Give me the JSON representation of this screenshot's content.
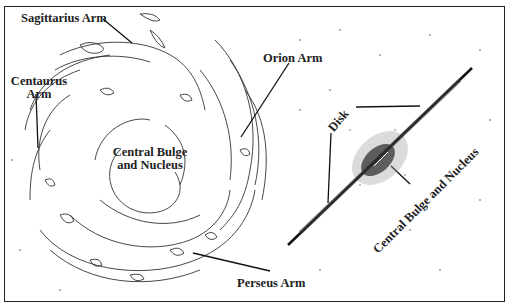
{
  "figure": {
    "title": "",
    "left_panel": {
      "description": "Face-on view of the Milky Way spiral structure",
      "labels": {
        "sagittarius": "Sagittarius Arm",
        "orion": "Orion Arm",
        "centaurus_line1": "Centaurus",
        "centaurus_line2": "Arm",
        "bulge_line1": "Central Bulge",
        "bulge_line2": "and Nucleus",
        "perseus": "Perseus Arm"
      }
    },
    "right_panel": {
      "description": "Edge-on view of the Milky Way",
      "labels": {
        "disk": "Disk",
        "bulge": "Central Bulge and Nucleus"
      }
    },
    "colors": {
      "ink": "#222222",
      "background": "#ffffff"
    }
  }
}
